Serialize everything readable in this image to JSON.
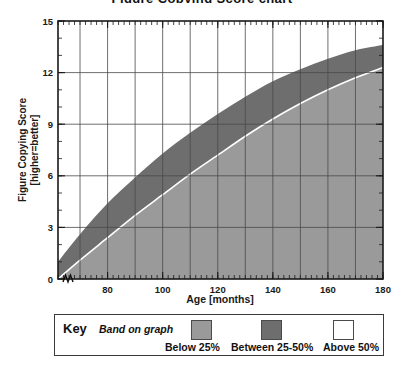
{
  "cut_off_title": "Figure Copying Score chart",
  "chart_data": {
    "type": "area",
    "title": "",
    "xlabel": "Age [months]",
    "ylabel": "Figure Copying Score [higher=better]",
    "xlim": [
      62,
      180
    ],
    "ylim": [
      0,
      15
    ],
    "xticks": [
      80,
      100,
      120,
      140,
      160,
      180
    ],
    "yticks": [
      0,
      3,
      6,
      9,
      12,
      15
    ],
    "xtick_labels": [
      "80",
      "100",
      "120",
      "140",
      "160",
      "180"
    ],
    "ytick_labels": [
      "0",
      "3",
      "6",
      "9",
      "12",
      "15"
    ],
    "x_minor_gridline_step": 10,
    "grid": true,
    "axis_break_at_origin": true,
    "legend_position": "below-plot",
    "x": [
      62,
      70,
      80,
      90,
      100,
      110,
      120,
      130,
      140,
      150,
      160,
      170,
      180
    ],
    "series": [
      {
        "name": "25th percentile",
        "label": "Below 25%",
        "band_label": "Below 25%",
        "color": "#9a9a9a",
        "values": [
          0.0,
          1.1,
          2.4,
          3.7,
          4.9,
          6.1,
          7.2,
          8.3,
          9.3,
          10.2,
          11.0,
          11.7,
          12.3
        ]
      },
      {
        "name": "50th percentile",
        "label": "Between 25-50%",
        "band_label": "Between 25-50%",
        "color": "#6e6e6e",
        "values": [
          1.0,
          2.6,
          4.4,
          5.9,
          7.3,
          8.5,
          9.6,
          10.6,
          11.5,
          12.2,
          12.8,
          13.3,
          13.6
        ]
      },
      {
        "name": "Above 50th percentile",
        "label": "Above 50%",
        "band_label": "Above 50%",
        "color": "#ffffff",
        "values": [
          15,
          15,
          15,
          15,
          15,
          15,
          15,
          15,
          15,
          15,
          15,
          15,
          15
        ]
      }
    ]
  },
  "legend": {
    "key_label": "Key",
    "band_label": "Band on graph",
    "entries": [
      {
        "label": "Below 25%",
        "color": "#9a9a9a"
      },
      {
        "label": "Between 25-50%",
        "color": "#6e6e6e"
      },
      {
        "label": "Above 50%",
        "color": "#ffffff"
      }
    ]
  },
  "colors": {
    "band_below_25": "#9a9a9a",
    "band_25_50": "#6e6e6e",
    "band_above_50": "#ffffff",
    "axis": "#1a1a1a",
    "grid": "#4a4a4a",
    "separator": "#ffffff"
  }
}
